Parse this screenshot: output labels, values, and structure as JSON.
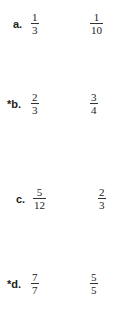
{
  "problems": [
    {
      "label": "a.",
      "starred": false,
      "first": {
        "num": "1",
        "den": "3"
      },
      "second": {
        "num": "1",
        "den": "10"
      }
    },
    {
      "label": "*b.",
      "starred": true,
      "first": {
        "num": "2",
        "den": "3"
      },
      "second": {
        "num": "3",
        "den": "4"
      }
    },
    {
      "label": "c.",
      "starred": false,
      "first": {
        "num": "5",
        "den": "12"
      },
      "second": {
        "num": "2",
        "den": "3"
      }
    },
    {
      "label": "*d.",
      "starred": true,
      "first": {
        "num": "7",
        "den": "7"
      },
      "second": {
        "num": "5",
        "den": "5"
      }
    }
  ]
}
